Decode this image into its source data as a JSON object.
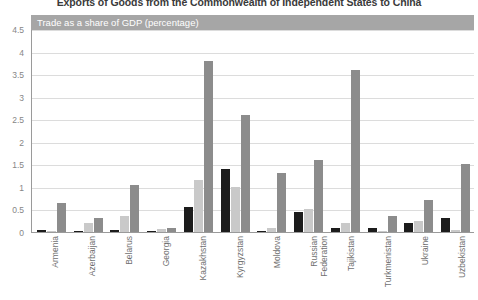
{
  "chart_title": "Exports of Goods from the Commonwealth of Independent States to China",
  "axis_banner": "Trade as a share of GDP (percentage)",
  "chart_data": {
    "type": "bar",
    "title": "Exports of Goods from the Commonwealth of Independent States to China",
    "xlabel": "",
    "ylabel": "Trade as a share of GDP (percentage)",
    "ylim": [
      0,
      4.5
    ],
    "yticks": [
      "0",
      "0.5",
      "1",
      "1.5",
      "2",
      "2.5",
      "3",
      "3.5",
      "4",
      "4.5"
    ],
    "grid": true,
    "legend": "none",
    "categories": [
      "Armenia",
      "Azerbaijan",
      "Belarus",
      "Georgia",
      "Kazakhstan",
      "Kyrgyzstan",
      "Moldova",
      "Russian Federation",
      "Tajikistan",
      "Turkmenistan",
      "Ukraine",
      "Uzbekistan"
    ],
    "series": [
      {
        "name": "series-1",
        "color": "#1c1c1c",
        "values": [
          0.05,
          0.02,
          0.05,
          0.03,
          0.55,
          1.4,
          0.02,
          0.45,
          0.1,
          0.1,
          0.2,
          0.3
        ]
      },
      {
        "name": "series-2",
        "color": "#c9c9c9",
        "values": [
          0.03,
          0.2,
          0.35,
          0.06,
          1.15,
          1.0,
          0.08,
          0.5,
          0.2,
          0.02,
          0.25,
          0.05
        ]
      },
      {
        "name": "series-3",
        "color": "#8c8c8c",
        "values": [
          0.65,
          0.3,
          1.05,
          0.1,
          3.8,
          2.6,
          1.3,
          1.6,
          3.6,
          0.35,
          0.7,
          1.5
        ]
      }
    ]
  },
  "colors": {
    "banner_background": "#a6a6a6",
    "banner_text": "#ffffff",
    "gridline": "#dcdcdc",
    "axis_line": "#9a9a9a",
    "tick_text": "#868686",
    "category_text": "#6f6f6f"
  }
}
